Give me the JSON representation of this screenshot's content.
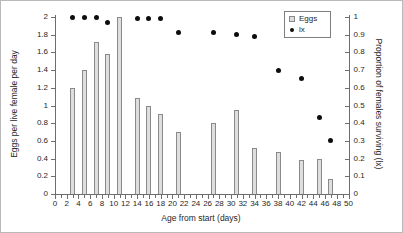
{
  "figure": {
    "background": "#ffffff",
    "border_color": "#b9b9b9",
    "bar_fill": "#dedede",
    "bar_border": "#8a8a8a",
    "dot_color": "#0d0d0d"
  },
  "legend": {
    "position": "top-right",
    "items": [
      {
        "label": "Eggs",
        "marker": "bar-swatch"
      },
      {
        "label": "lx",
        "marker": "dot"
      }
    ]
  },
  "chart_data": {
    "type": "bar",
    "subtype": "combo-bar-scatter",
    "x": [
      3,
      5,
      7,
      9,
      11,
      14,
      16,
      18,
      21,
      27,
      31,
      34,
      38,
      42,
      45,
      47
    ],
    "series": [
      {
        "name": "Eggs",
        "type": "bar",
        "axis": "left",
        "values": [
          1.2,
          1.4,
          1.72,
          1.58,
          2.0,
          1.08,
          1.0,
          0.9,
          0.7,
          0.8,
          0.95,
          0.52,
          0.47,
          0.38,
          0.4,
          0.17
        ]
      },
      {
        "name": "lx",
        "type": "scatter",
        "axis": "right",
        "values": [
          1.0,
          1.0,
          1.0,
          0.97,
          null,
          0.99,
          0.99,
          0.99,
          0.91,
          0.91,
          0.9,
          0.89,
          0.7,
          0.65,
          0.43,
          0.3
        ]
      }
    ],
    "xlabel": "Age from start (days)",
    "ylabel_left": "Eggs per live female per day",
    "ylabel_right": "Proportion of females surviving (lx)",
    "xlim": [
      0,
      50
    ],
    "ylim_left": [
      0,
      2
    ],
    "ylim_right": [
      0,
      1
    ],
    "grid": false,
    "x_tick_labels": [
      "0",
      "2",
      "4",
      "6",
      "8",
      "10",
      "12",
      "14",
      "16",
      "18",
      "20",
      "22",
      "24",
      "26",
      "28",
      "30",
      "32",
      "34",
      "36",
      "38",
      "40",
      "42",
      "44",
      "46",
      "48",
      "50"
    ],
    "y_tick_labels_left": [
      "0",
      "0.2",
      "0.4",
      "0.6",
      "0.8",
      "1",
      "1.2",
      "1.4",
      "1.6",
      "1.8",
      "2"
    ],
    "y_tick_labels_right": [
      "0",
      "0.1",
      "0.2",
      "0.3",
      "0.4",
      "0.5",
      "0.6",
      "0.7",
      "0.8",
      "0.9",
      "1"
    ]
  }
}
